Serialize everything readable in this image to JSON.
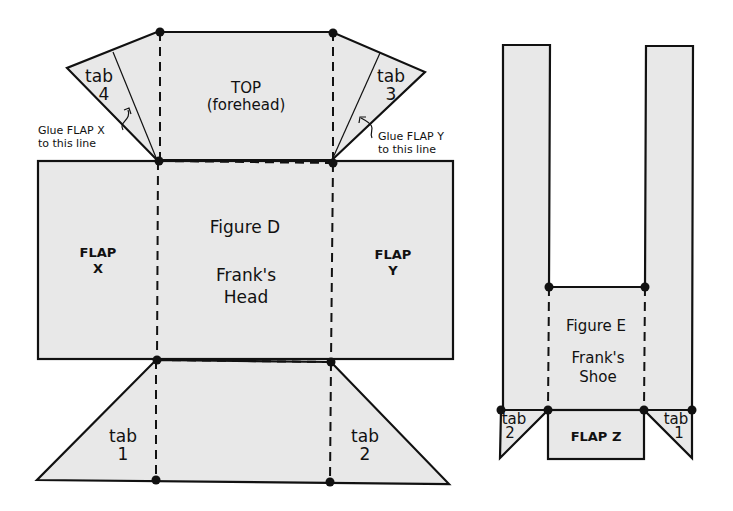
{
  "figure_d": {
    "title": "Figure D",
    "subtitle_line1": "Frank's",
    "subtitle_line2": "Head",
    "top_label_line1": "TOP",
    "top_label_line2": "(forehead)",
    "flap_x_line1": "FLAP",
    "flap_x_line2": "X",
    "flap_y_line1": "FLAP",
    "flap_y_line2": "Y",
    "tab4_line1": "tab",
    "tab4_line2": "4",
    "tab3_line1": "tab",
    "tab3_line2": "3",
    "tab1_line1": "tab",
    "tab1_line2": "1",
    "tab2_line1": "tab",
    "tab2_line2": "2",
    "note_left_line1": "Glue FLAP X",
    "note_left_line2": "to this line",
    "note_right_line1": "Glue FLAP Y",
    "note_right_line2": "to this line"
  },
  "figure_e": {
    "title": "Figure E",
    "subtitle_line1": "Frank's",
    "subtitle_line2": "Shoe",
    "flap_z": "FLAP Z",
    "tab2_line1": "tab",
    "tab2_line2": "2",
    "tab1_line1": "tab",
    "tab1_line2": "1"
  },
  "colors": {
    "paper_fill": "#e8e8e8",
    "line": "#111111",
    "background": "#ffffff"
  }
}
